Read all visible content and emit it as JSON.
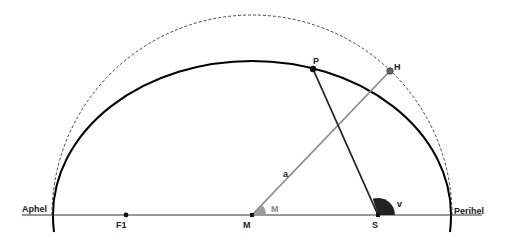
{
  "diagram": {
    "labels": {
      "aphel": "Aphel",
      "perihel": "Perihel",
      "focus1": "F1",
      "center": "M",
      "sun": "S",
      "planet": "P",
      "auxiliary_point": "H",
      "semi_major_axis": "a",
      "mean_anomaly_angle": "M",
      "true_anomaly_angle": "v"
    },
    "colors": {
      "ellipse": "#000000",
      "circle_dashed": "#333333",
      "axis_line": "#333333",
      "radius_line": "#8a8a8a",
      "angle_M_fill": "#999999",
      "angle_v_fill": "#222222",
      "point_H": "#666666"
    }
  }
}
